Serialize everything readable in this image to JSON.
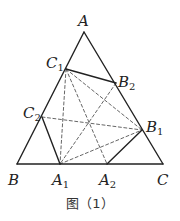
{
  "caption": "图（1）",
  "labels": {
    "A": {
      "main": "A",
      "sub": ""
    },
    "B": {
      "main": "B",
      "sub": ""
    },
    "C": {
      "main": "C",
      "sub": ""
    },
    "A1": {
      "main": "A",
      "sub": "1"
    },
    "A2": {
      "main": "A",
      "sub": "2"
    },
    "B1": {
      "main": "B",
      "sub": "1"
    },
    "B2": {
      "main": "B",
      "sub": "2"
    },
    "C1": {
      "main": "C",
      "sub": "1"
    },
    "C2": {
      "main": "C",
      "sub": "2"
    }
  },
  "points": {
    "A": [
      84,
      32
    ],
    "B": [
      17,
      164
    ],
    "C": [
      163,
      164
    ],
    "A1": [
      60,
      164
    ],
    "A2": [
      107,
      164
    ],
    "B1": [
      142,
      130
    ],
    "B2": [
      116,
      83
    ],
    "C1": [
      66,
      69
    ],
    "C2": [
      42,
      117
    ]
  },
  "solid_segments": [
    [
      "A",
      "B"
    ],
    [
      "B",
      "C"
    ],
    [
      "C",
      "A"
    ],
    [
      "C1",
      "B2"
    ],
    [
      "C2",
      "A1"
    ],
    [
      "A2",
      "B1"
    ]
  ],
  "dashed_segments": [
    [
      "C1",
      "A1"
    ],
    [
      "C1",
      "A2"
    ],
    [
      "C1",
      "B1"
    ],
    [
      "B2",
      "A1"
    ],
    [
      "C2",
      "B1"
    ],
    [
      "A1",
      "B1"
    ]
  ],
  "colors": {
    "stroke": "#222222",
    "dash": "#555555"
  }
}
